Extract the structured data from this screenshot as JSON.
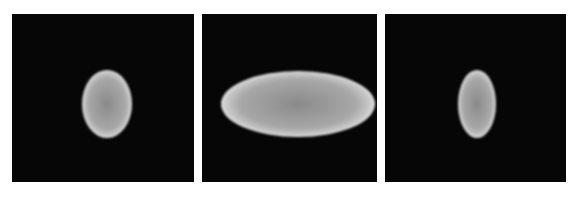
{
  "figure": {
    "background": "#ffffff",
    "panels": [
      {
        "id": "panel-1",
        "x": 12,
        "y": 14,
        "w": 182,
        "h": 168,
        "bg": "#060606",
        "ellipse": {
          "cx": 95,
          "cy": 90,
          "rx": 25,
          "ry": 34
        }
      },
      {
        "id": "panel-2",
        "x": 202,
        "y": 14,
        "w": 175,
        "h": 168,
        "bg": "#060606",
        "ellipse": {
          "cx": 96,
          "cy": 90,
          "rx": 77,
          "ry": 33
        }
      },
      {
        "id": "panel-3",
        "x": 385,
        "y": 14,
        "w": 181,
        "h": 168,
        "bg": "#060606",
        "ellipse": {
          "cx": 92,
          "cy": 90,
          "rx": 19,
          "ry": 34
        }
      }
    ],
    "ellipse_colors": {
      "center": "#8a8a8a",
      "edge": "#c8c8c8",
      "rim": "#e0e0e0"
    }
  }
}
